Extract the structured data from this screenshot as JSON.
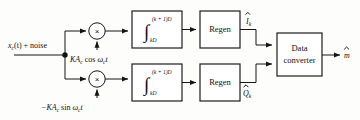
{
  "figure": {
    "kind": "block-diagram"
  },
  "input": {
    "label_main": "x",
    "label_sub": "c",
    "label_rest": "(t) + noise"
  },
  "local_oscillators": {
    "inphase": {
      "gain": "KA",
      "gain_sub": "c",
      "trig": " cos ",
      "omega": "ω",
      "omega_sub": "c",
      "time": "t"
    },
    "quadrature": {
      "gain": "−KA",
      "gain_sub": "c",
      "trig": " sin ",
      "omega": "ω",
      "omega_sub": "c",
      "time": "t"
    }
  },
  "multipliers": {
    "symbol": "×",
    "inphase_name": "inphase-multiplier",
    "quadrature_name": "quadrature-multiplier"
  },
  "integrators": {
    "symbol": "∫",
    "upper_limit": "(k + 1)D",
    "lower_limit": "kD"
  },
  "regen": {
    "label": "Regen"
  },
  "outputs": {
    "inphase_symbol": "I",
    "inphase_sub": "k",
    "quadrature_symbol": "Q",
    "quadrature_sub": "k",
    "final_symbol": "m"
  },
  "data_converter": {
    "line1": "Data",
    "line2": "converter"
  },
  "colors": {
    "ink": "#141414",
    "paper": "#fdfdfb",
    "box_fill": "#ffffff"
  }
}
